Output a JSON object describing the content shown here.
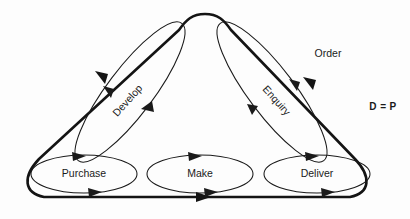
{
  "diagram": {
    "background_color": "#fdfdfd",
    "line_color": "#141414",
    "labels": {
      "order": "Order",
      "d_equals_p": "D = P",
      "develop": "Develop",
      "enquiry": "Enquiry",
      "purchase": "Purchase",
      "make": "Make",
      "deliver": "Deliver"
    },
    "nodes": [
      {
        "id": "purchase",
        "label": "Purchase",
        "shape": "ellipse",
        "cx": 84,
        "cy": 174,
        "rx": 53,
        "ry": 19,
        "rotation": 0
      },
      {
        "id": "make",
        "label": "Make",
        "shape": "ellipse",
        "cx": 200,
        "cy": 174,
        "rx": 53,
        "ry": 19,
        "rotation": 0
      },
      {
        "id": "deliver",
        "label": "Deliver",
        "shape": "ellipse",
        "cx": 317,
        "cy": 174,
        "rx": 53,
        "ry": 19,
        "rotation": 0
      },
      {
        "id": "develop",
        "label": "Develop",
        "shape": "ellipse",
        "cx": 130,
        "cy": 92,
        "rx": 85,
        "ry": 22,
        "rotation": -53
      },
      {
        "id": "enquiry",
        "label": "Enquiry",
        "shape": "ellipse",
        "cx": 272,
        "cy": 92,
        "rx": 85,
        "ry": 22,
        "rotation": 53
      }
    ],
    "outer_loop": {
      "shape": "rounded-triangle",
      "stroke_width": 2.6,
      "apex_label": "Order",
      "bottom_flow_direction": "right"
    },
    "flow_arrows": [
      {
        "on": "outer-left-edge",
        "direction": "up-left",
        "count": 1
      },
      {
        "on": "outer-right-edge",
        "direction": "up-left",
        "count": 1
      },
      {
        "on": "outer-bottom-edge",
        "direction": "right",
        "count": 1
      },
      {
        "on": "develop-ellipse",
        "direction": "up-left-and-up-right",
        "count": 2
      },
      {
        "on": "enquiry-ellipse",
        "direction": "down-left",
        "count": 1
      },
      {
        "on": "purchase-ellipse",
        "direction": "ccw",
        "count": 2
      },
      {
        "on": "make-ellipse",
        "direction": "ccw",
        "count": 2
      },
      {
        "on": "deliver-ellipse",
        "direction": "ccw",
        "count": 2
      }
    ]
  }
}
